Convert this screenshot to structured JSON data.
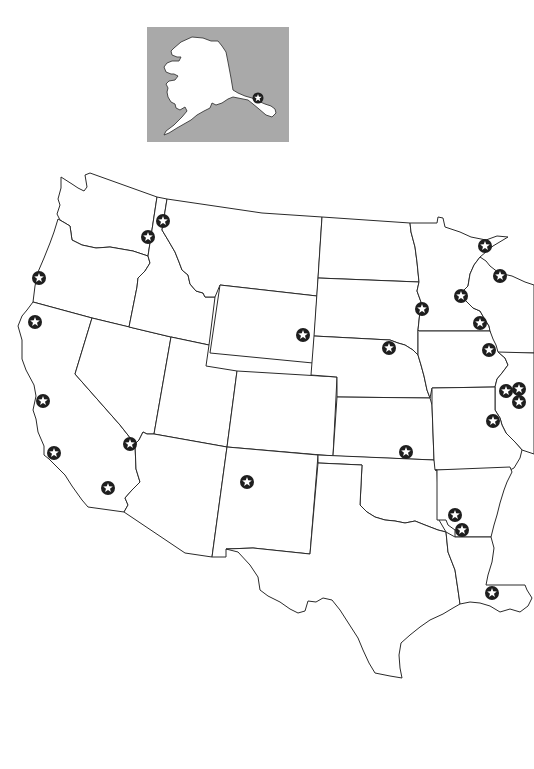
{
  "map": {
    "type": "outline-map",
    "region": "Western and Central United States",
    "colors": {
      "background": "#ffffff",
      "inset_background": "#a9a9a9",
      "land": "#ffffff",
      "border": "#2a2a2a",
      "marker_fill": "#1e1e1e",
      "marker_star": "#ffffff"
    },
    "inset": {
      "label": "Alaska",
      "x": 147,
      "y": 27,
      "width": 142,
      "height": 115,
      "markers": [
        {
          "id": "ak-1",
          "x": 258,
          "y": 98
        }
      ]
    },
    "marker_icon": "star-in-circle-icon",
    "markers": [
      {
        "id": "m-01",
        "region": "Washington (east)",
        "x": 148,
        "y": 237
      },
      {
        "id": "m-02",
        "region": "Idaho (north)",
        "x": 163,
        "y": 221
      },
      {
        "id": "m-03",
        "region": "Oregon (coast)",
        "x": 39,
        "y": 278
      },
      {
        "id": "m-04",
        "region": "California (north coast)",
        "x": 35,
        "y": 322
      },
      {
        "id": "m-05",
        "region": "California (bay area)",
        "x": 43,
        "y": 401
      },
      {
        "id": "m-06",
        "region": "California (central coast)",
        "x": 54,
        "y": 453
      },
      {
        "id": "m-07",
        "region": "California (south)",
        "x": 108,
        "y": 488
      },
      {
        "id": "m-08",
        "region": "California/Nevada border",
        "x": 130,
        "y": 444
      },
      {
        "id": "m-09",
        "region": "Wyoming (southeast)",
        "x": 303,
        "y": 335
      },
      {
        "id": "m-10",
        "region": "Nebraska (east)",
        "x": 389,
        "y": 348
      },
      {
        "id": "m-11",
        "region": "Kansas (south)",
        "x": 406,
        "y": 452
      },
      {
        "id": "m-12",
        "region": "New Mexico",
        "x": 247,
        "y": 482
      },
      {
        "id": "m-13",
        "region": "Minnesota (Duluth)",
        "x": 485,
        "y": 246
      },
      {
        "id": "m-14",
        "region": "Wisconsin (north)",
        "x": 500,
        "y": 276
      },
      {
        "id": "m-15",
        "region": "Minnesota (central)",
        "x": 461,
        "y": 296
      },
      {
        "id": "m-16",
        "region": "South Dakota (east)",
        "x": 422,
        "y": 309
      },
      {
        "id": "m-17",
        "region": "Minnesota (southeast)",
        "x": 480,
        "y": 323
      },
      {
        "id": "m-18",
        "region": "Iowa (east)",
        "x": 489,
        "y": 350
      },
      {
        "id": "m-19",
        "region": "Illinois (west) A",
        "x": 506,
        "y": 391
      },
      {
        "id": "m-20",
        "region": "Illinois (west) B",
        "x": 519,
        "y": 389
      },
      {
        "id": "m-21",
        "region": "Illinois (west) C",
        "x": 519,
        "y": 402
      },
      {
        "id": "m-22",
        "region": "Missouri (east)",
        "x": 493,
        "y": 421
      },
      {
        "id": "m-23",
        "region": "Arkansas (west) A",
        "x": 455,
        "y": 515
      },
      {
        "id": "m-24",
        "region": "Arkansas (west) B",
        "x": 462,
        "y": 530
      },
      {
        "id": "m-25",
        "region": "Louisiana (south)",
        "x": 492,
        "y": 593
      }
    ]
  }
}
